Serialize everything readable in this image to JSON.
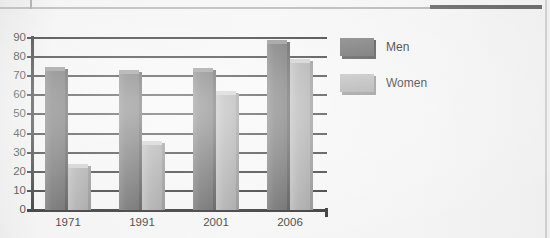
{
  "chart_data": {
    "type": "bar",
    "title": "",
    "xlabel": "",
    "ylabel": "",
    "ylim": [
      0,
      90
    ],
    "ytick_step": 10,
    "yticks": [
      90,
      80,
      70,
      60,
      50,
      40,
      30,
      20,
      10,
      0
    ],
    "grid": true,
    "legend_position": "right",
    "categories": [
      "1971",
      "1991",
      "2001",
      "2006"
    ],
    "series": [
      {
        "name": "Men",
        "values": [
          73,
          71,
          72,
          87
        ],
        "color": "#6a6a6a"
      },
      {
        "name": "Women",
        "values": [
          22,
          34,
          60,
          77
        ],
        "color": "#a9a9a9"
      }
    ]
  },
  "legend": {
    "items": [
      {
        "label": "Men",
        "swatch": "men-swatch"
      },
      {
        "label": "Women",
        "swatch": "women-swatch"
      }
    ]
  },
  "artifacts": {
    "ghost_text": ""
  }
}
